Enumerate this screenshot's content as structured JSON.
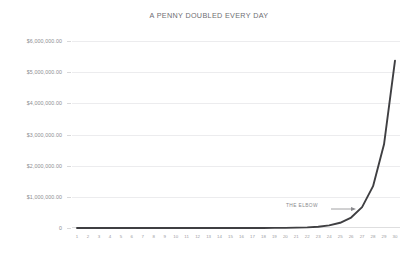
{
  "chart_data": {
    "type": "line",
    "title": "A PENNY DOUBLED EVERY DAY",
    "xlabel": "",
    "ylabel": "",
    "grid": true,
    "legend": false,
    "xlim": [
      1,
      30
    ],
    "ylim": [
      0,
      6000000
    ],
    "x": [
      1,
      2,
      3,
      4,
      5,
      6,
      7,
      8,
      9,
      10,
      11,
      12,
      13,
      14,
      15,
      16,
      17,
      18,
      19,
      20,
      21,
      22,
      23,
      24,
      25,
      26,
      27,
      28,
      29,
      30
    ],
    "x_tick_labels": [
      "1",
      "2",
      "3",
      "4",
      "5",
      "6",
      "7",
      "8",
      "9",
      "10",
      "11",
      "12",
      "13",
      "14",
      "15",
      "16",
      "17",
      "18",
      "19",
      "20",
      "21",
      "22",
      "23",
      "24",
      "25",
      "26",
      "27",
      "28",
      "29",
      "30"
    ],
    "y_tick_labels": [
      "$6,000,000.00",
      "$5,000,000.00",
      "$4,000,000.00",
      "$3,000,000.00",
      "$2,000,000.00",
      "$1,000,000.00",
      "0"
    ],
    "y_tick_values": [
      6000000,
      5000000,
      4000000,
      3000000,
      2000000,
      1000000,
      0
    ],
    "series": [
      {
        "name": "Penny doubled",
        "values": [
          0.01,
          0.02,
          0.04,
          0.08,
          0.16,
          0.32,
          0.64,
          1.28,
          2.56,
          5.12,
          10.24,
          20.48,
          40.96,
          81.92,
          163.84,
          327.68,
          655.36,
          1310.72,
          2621.44,
          5242.88,
          10485.76,
          20971.52,
          41943.04,
          83886.08,
          167772.16,
          335544.32,
          671088.64,
          1342177.28,
          2684354.56,
          5368709.12
        ]
      }
    ],
    "annotations": [
      {
        "text": "THE ELBOW",
        "target_x": 25,
        "arrow": "right"
      }
    ],
    "colors": {
      "line": "#3f3f42",
      "grid": "#ececee",
      "axis": "#dededf",
      "tick_text": "#8d8d91",
      "title_text": "#6e6e72",
      "annotation_text": "#8a8a8e",
      "background": "#ffffff"
    }
  }
}
